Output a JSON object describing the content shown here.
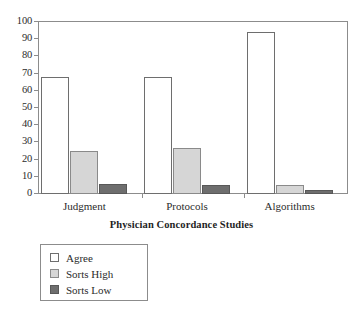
{
  "chart_data": {
    "type": "bar",
    "title": "",
    "xlabel": "Physician Concordance Studies",
    "ylabel": "",
    "ylim": [
      0,
      100
    ],
    "yticks": [
      0,
      10,
      20,
      30,
      40,
      50,
      60,
      70,
      80,
      90,
      100
    ],
    "grid": false,
    "legend_position": "below-left",
    "categories": [
      "Judgment",
      "Protocols",
      "Algorithms"
    ],
    "series": [
      {
        "name": "Agree",
        "color": "#ffffff",
        "values": [
          68,
          68,
          94
        ]
      },
      {
        "name": "Sorts High",
        "color": "#d6d6d6",
        "values": [
          25,
          27,
          5
        ]
      },
      {
        "name": "Sorts Low",
        "color": "#6e6e6e",
        "values": [
          6,
          5,
          2.5
        ]
      }
    ]
  },
  "axis": {
    "x_title": "Physician Concordance Studies",
    "tick_labels": [
      "100",
      "90",
      "80",
      "70",
      "60",
      "50",
      "40",
      "30",
      "20",
      "10",
      "0"
    ],
    "category_labels": [
      "Judgment",
      "Protocols",
      "Algorithms"
    ]
  },
  "legend": {
    "items": [
      {
        "label": "Agree"
      },
      {
        "label": "Sorts High"
      },
      {
        "label": "Sorts Low"
      }
    ]
  }
}
